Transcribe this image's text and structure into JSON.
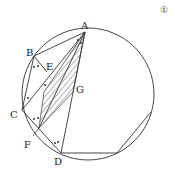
{
  "figure_number": "①",
  "labels": {
    "A": "A",
    "B": "B",
    "C": "C",
    "D": "D",
    "E": "E",
    "F": "F",
    "G": "G"
  },
  "points": {
    "A": [
      85,
      32
    ],
    "B": [
      34,
      56
    ],
    "C": [
      22,
      110
    ],
    "D": [
      61,
      153
    ],
    "E": [
      47,
      72
    ],
    "F": [
      39,
      128
    ],
    "G": [
      73,
      92
    ],
    "P": [
      117,
      153
    ],
    "Q": [
      151,
      112
    ]
  },
  "circle": {
    "cx": 88,
    "cy": 94,
    "r": 66
  },
  "colors": {
    "stroke": "#333333",
    "hatch": "#444444"
  }
}
